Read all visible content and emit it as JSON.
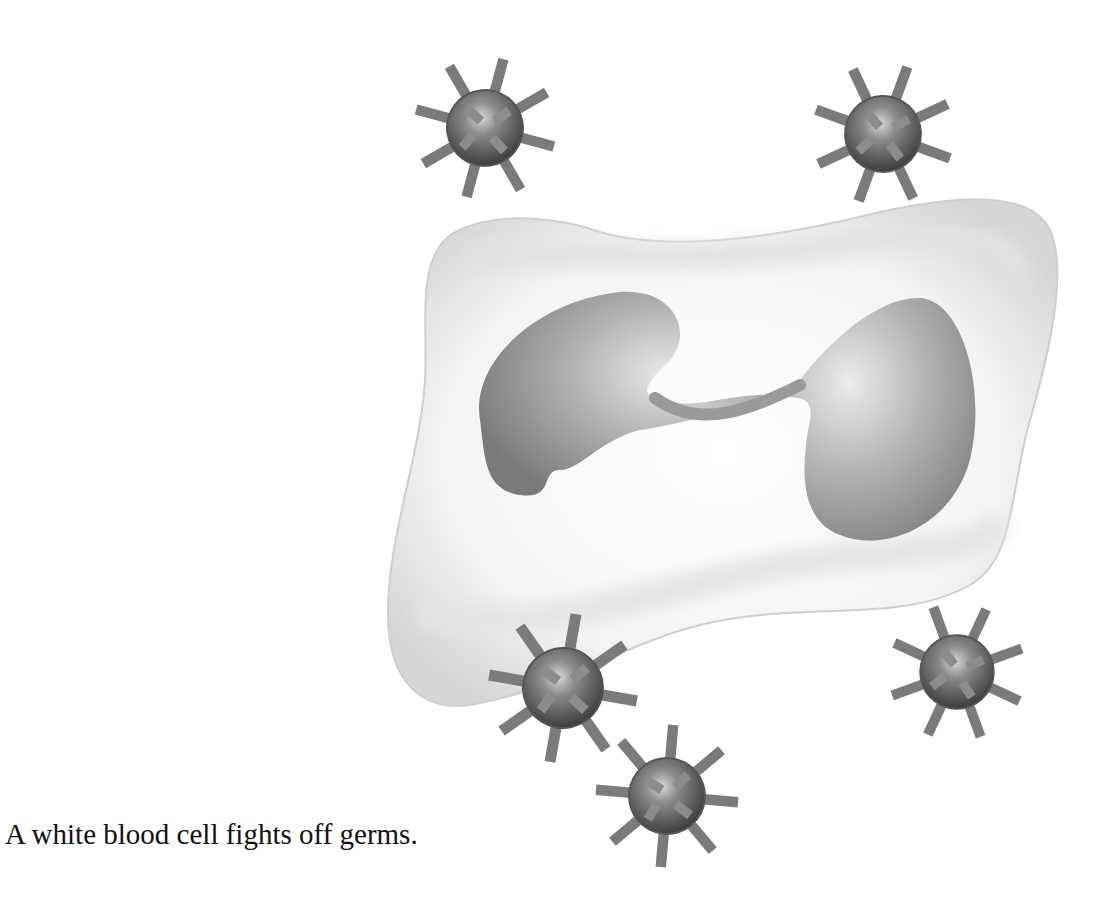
{
  "figure": {
    "caption": "A white blood cell fights off germs.",
    "nucleus_lobes": 2,
    "germs": [
      {
        "id": "germ-top-left",
        "cx": 485,
        "cy": 128,
        "r": 44
      },
      {
        "id": "germ-top-right",
        "cx": 883,
        "cy": 134,
        "r": 44
      },
      {
        "id": "germ-bottom-left",
        "cx": 563,
        "cy": 688,
        "r": 47
      },
      {
        "id": "germ-bottom-right",
        "cx": 957,
        "cy": 672,
        "r": 42
      },
      {
        "id": "germ-bottom-center",
        "cx": 667,
        "cy": 796,
        "r": 44
      }
    ],
    "colors": {
      "cell_fill": "#f7f7f7",
      "cell_shade": "#d9d9d9",
      "nucleus": "#8c8c8c",
      "germ_body": "#6e6e6e",
      "germ_spike": "#8a8a8a"
    }
  }
}
